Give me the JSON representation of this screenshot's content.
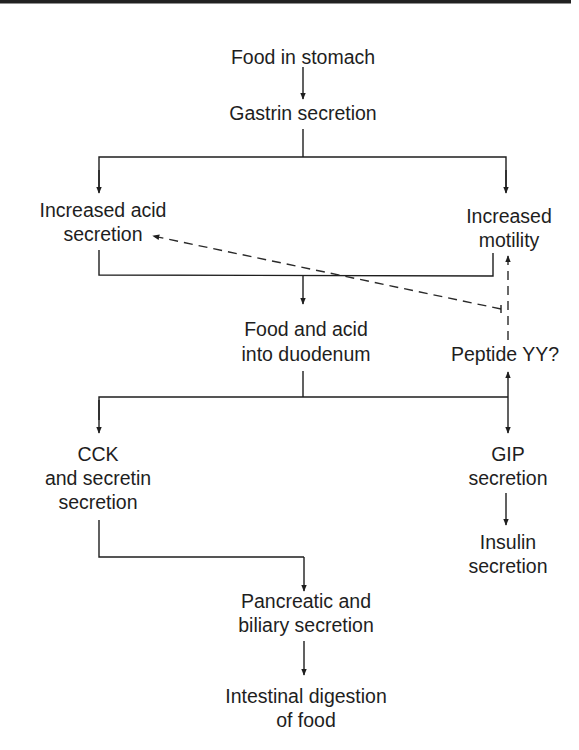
{
  "diagram": {
    "title": "",
    "nodes": {
      "food_in_stomach": {
        "lines": [
          "Food in stomach"
        ]
      },
      "gastrin": {
        "lines": [
          "Gastrin secretion"
        ]
      },
      "acid_secretion": {
        "lines": [
          "Increased acid",
          "secretion"
        ]
      },
      "motility": {
        "lines": [
          "Increased",
          "motility"
        ]
      },
      "duodenum": {
        "lines": [
          "Food and acid",
          "into duodenum"
        ]
      },
      "peptide_yy": {
        "lines": [
          "Peptide YY?"
        ]
      },
      "cck": {
        "lines": [
          "CCK",
          "and secretin",
          "secretion"
        ]
      },
      "gip": {
        "lines": [
          "GIP",
          "secretion"
        ]
      },
      "insulin": {
        "lines": [
          "Insulin",
          "secretion"
        ]
      },
      "pancreatic": {
        "lines": [
          "Pancreatic and",
          "biliary secretion"
        ]
      },
      "digestion": {
        "lines": [
          "Intestinal digestion",
          "of food"
        ]
      }
    },
    "edges": [
      {
        "from": "Food in stomach",
        "to": "Gastrin secretion",
        "style": "solid"
      },
      {
        "from": "Gastrin secretion",
        "to": "Increased acid secretion",
        "style": "solid"
      },
      {
        "from": "Gastrin secretion",
        "to": "Increased motility",
        "style": "solid"
      },
      {
        "from": "Increased acid secretion + Increased motility",
        "to": "Food and acid into duodenum",
        "style": "solid"
      },
      {
        "from": "Food and acid into duodenum",
        "to": "CCK and secretin secretion",
        "style": "solid"
      },
      {
        "from": "Food and acid into duodenum",
        "to": "GIP secretion",
        "style": "solid"
      },
      {
        "from": "Food and acid into duodenum",
        "to": "Peptide YY?",
        "style": "solid"
      },
      {
        "from": "Peptide YY?",
        "to": "Increased acid secretion",
        "style": "dashed"
      },
      {
        "from": "Peptide YY?",
        "to": "Increased motility",
        "style": "dashed"
      },
      {
        "from": "GIP secretion",
        "to": "Insulin secretion",
        "style": "solid"
      },
      {
        "from": "CCK and secretin secretion",
        "to": "Pancreatic and biliary secretion",
        "style": "solid"
      },
      {
        "from": "Pancreatic and biliary secretion",
        "to": "Intestinal digestion of food",
        "style": "solid"
      }
    ]
  }
}
